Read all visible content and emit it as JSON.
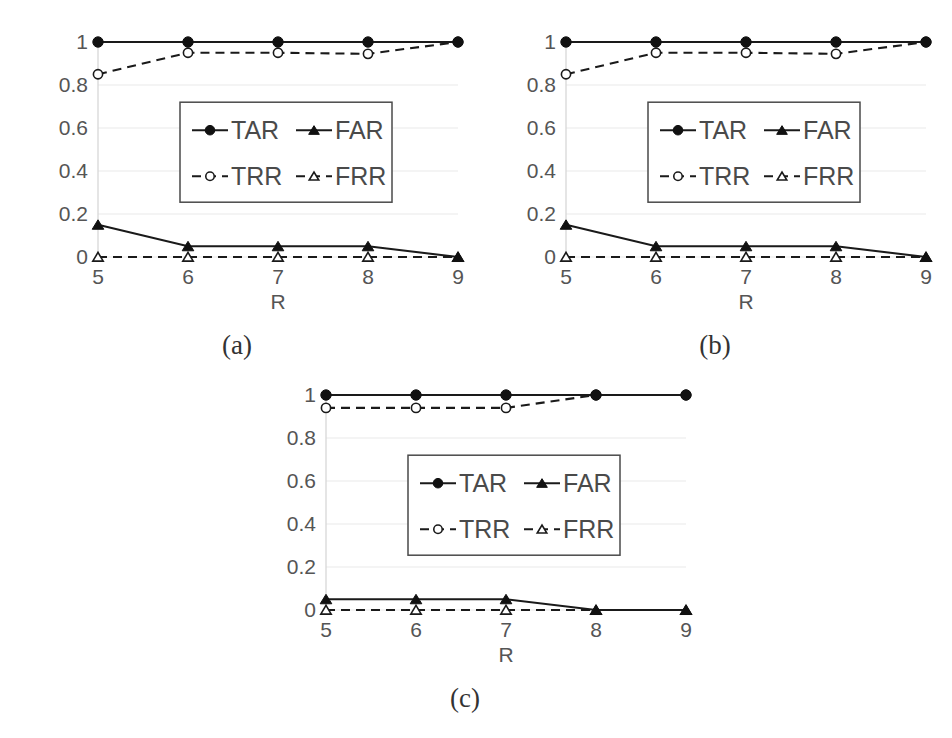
{
  "figure": {
    "background": "#ffffff",
    "width": 952,
    "height": 738,
    "panel_count": 3
  },
  "colors": {
    "line": "#1a1a1a",
    "text": "#555555",
    "grid": "#e9e9e9",
    "axis": "#d4d4d4",
    "marker_fill": "#111111",
    "marker_open_fill": "#ffffff",
    "legend_border": "#4a4a4a"
  },
  "captions": {
    "a": "(a)",
    "b": "(b)",
    "c": "(c)"
  },
  "axis": {
    "xlabel": "R",
    "ylabel": "",
    "ytick_labels": [
      "0",
      "0.2",
      "0.4",
      "0.6",
      "0.8",
      "1"
    ],
    "xtick_labels": [
      "5",
      "6",
      "7",
      "8",
      "9"
    ],
    "ylim": [
      0,
      1
    ],
    "xlim": [
      5,
      9
    ],
    "grid": true,
    "legend_position": "center"
  },
  "legend": {
    "entries": [
      {
        "label": "TAR",
        "style": "solid",
        "marker": "filled-circle"
      },
      {
        "label": "FAR",
        "style": "solid",
        "marker": "filled-triangle"
      },
      {
        "label": "TRR",
        "style": "dashed",
        "marker": "open-circle"
      },
      {
        "label": "FRR",
        "style": "dashed",
        "marker": "open-triangle"
      }
    ]
  },
  "chart_data": [
    {
      "type": "line",
      "panel": "(a)",
      "title": "",
      "xlabel": "R",
      "ylabel": "",
      "x": [
        5,
        6,
        7,
        8,
        9
      ],
      "xlim": [
        5,
        9
      ],
      "ylim": [
        0,
        1
      ],
      "yticks": [
        0,
        0.2,
        0.4,
        0.6,
        0.8,
        1
      ],
      "grid": true,
      "legend_position": "center",
      "series": [
        {
          "name": "TAR",
          "style": "solid",
          "marker": "filled-circle",
          "values": [
            1.0,
            1.0,
            1.0,
            1.0,
            1.0
          ]
        },
        {
          "name": "FAR",
          "style": "solid",
          "marker": "filled-triangle",
          "values": [
            0.15,
            0.05,
            0.05,
            0.05,
            0.0
          ]
        },
        {
          "name": "TRR",
          "style": "dashed",
          "marker": "open-circle",
          "values": [
            0.85,
            0.95,
            0.95,
            0.945,
            1.0
          ]
        },
        {
          "name": "FRR",
          "style": "dashed",
          "marker": "open-triangle",
          "values": [
            0.0,
            0.0,
            0.0,
            0.0,
            0.0
          ]
        }
      ]
    },
    {
      "type": "line",
      "panel": "(b)",
      "title": "",
      "xlabel": "R",
      "ylabel": "",
      "x": [
        5,
        6,
        7,
        8,
        9
      ],
      "xlim": [
        5,
        9
      ],
      "ylim": [
        0,
        1
      ],
      "yticks": [
        0,
        0.2,
        0.4,
        0.6,
        0.8,
        1
      ],
      "grid": true,
      "legend_position": "center",
      "series": [
        {
          "name": "TAR",
          "style": "solid",
          "marker": "filled-circle",
          "values": [
            1.0,
            1.0,
            1.0,
            1.0,
            1.0
          ]
        },
        {
          "name": "FAR",
          "style": "solid",
          "marker": "filled-triangle",
          "values": [
            0.15,
            0.05,
            0.05,
            0.05,
            0.0
          ]
        },
        {
          "name": "TRR",
          "style": "dashed",
          "marker": "open-circle",
          "values": [
            0.85,
            0.95,
            0.95,
            0.945,
            1.0
          ]
        },
        {
          "name": "FRR",
          "style": "dashed",
          "marker": "open-triangle",
          "values": [
            0.0,
            0.0,
            0.0,
            0.0,
            0.0
          ]
        }
      ]
    },
    {
      "type": "line",
      "panel": "(c)",
      "title": "",
      "xlabel": "R",
      "ylabel": "",
      "x": [
        5,
        6,
        7,
        8,
        9
      ],
      "xlim": [
        5,
        9
      ],
      "ylim": [
        0,
        1
      ],
      "yticks": [
        0,
        0.2,
        0.4,
        0.6,
        0.8,
        1
      ],
      "grid": true,
      "legend_position": "center",
      "series": [
        {
          "name": "TAR",
          "style": "solid",
          "marker": "filled-circle",
          "values": [
            1.0,
            1.0,
            1.0,
            1.0,
            1.0
          ]
        },
        {
          "name": "FAR",
          "style": "solid",
          "marker": "filled-triangle",
          "values": [
            0.05,
            0.05,
            0.05,
            0.0,
            0.0
          ]
        },
        {
          "name": "TRR",
          "style": "dashed",
          "marker": "open-circle",
          "values": [
            0.94,
            0.94,
            0.94,
            1.0,
            1.0
          ]
        },
        {
          "name": "FRR",
          "style": "dashed",
          "marker": "open-triangle",
          "values": [
            0.0,
            0.0,
            0.0,
            0.0,
            0.0
          ]
        }
      ]
    }
  ]
}
